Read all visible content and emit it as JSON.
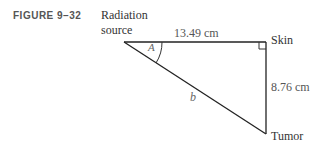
{
  "figure": {
    "label": "FIGURE 9–32",
    "source_line1": "Radiation",
    "source_line2": "source",
    "skin": "Skin",
    "tumor": "Tumor",
    "top_side": "13.49 cm",
    "right_side": "8.76 cm",
    "hypotenuse": "b",
    "angle": "A"
  }
}
